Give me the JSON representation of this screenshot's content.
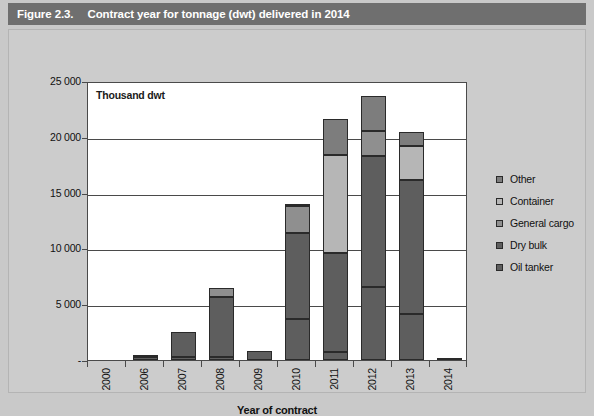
{
  "figure": {
    "number": "Figure 2.3.",
    "title": "Contract year for tonnage (dwt) delivered in 2014"
  },
  "chart_data": {
    "type": "bar",
    "stacked": true,
    "title": "Contract year for tonnage (dwt) delivered in 2014",
    "unit_label": "Thousand dwt",
    "xlabel": "Year of contract",
    "ylabel": "",
    "ylim": [
      0,
      25000
    ],
    "ytick_values": [
      0,
      5000,
      10000,
      15000,
      20000,
      25000
    ],
    "ytick_labels": [
      "-",
      "5 000",
      "10 000",
      "15 000",
      "20 000",
      "25 000"
    ],
    "grid": true,
    "legend_position": "right",
    "categories": [
      "2000",
      "2006",
      "2007",
      "2008",
      "2009",
      "2010",
      "2011",
      "2012",
      "2013",
      "2014"
    ],
    "series": [
      {
        "name": "Oil tanker",
        "key": "oil_tanker",
        "color": "#5e5e5e",
        "values": [
          0,
          300,
          300,
          250,
          0,
          3700,
          700,
          6500,
          4100,
          100
        ]
      },
      {
        "name": "Dry bulk",
        "key": "dry_bulk",
        "color": "#5e5e5e",
        "values": [
          0,
          100,
          2200,
          5400,
          850,
          7700,
          8900,
          11800,
          12000,
          0
        ]
      },
      {
        "name": "General cargo",
        "key": "general_cargo",
        "color": "#8f8f8f",
        "values": [
          0,
          0,
          0,
          800,
          0,
          2400,
          0,
          2200,
          0,
          0
        ]
      },
      {
        "name": "Container",
        "key": "container",
        "color": "#b6b6b6",
        "values": [
          0,
          0,
          0,
          0,
          0,
          200,
          8800,
          0,
          3100,
          0
        ]
      },
      {
        "name": "Other",
        "key": "other",
        "color": "#7d7d7d",
        "values": [
          0,
          0,
          0,
          0,
          0,
          0,
          3200,
          3200,
          1200,
          0
        ]
      }
    ],
    "totals": [
      0,
      400,
      2500,
      6450,
      850,
      14000,
      21600,
      23700,
      20400,
      100
    ],
    "legend": [
      "Other",
      "Container",
      "General cargo",
      "Dry bulk",
      "Oil tanker"
    ]
  }
}
